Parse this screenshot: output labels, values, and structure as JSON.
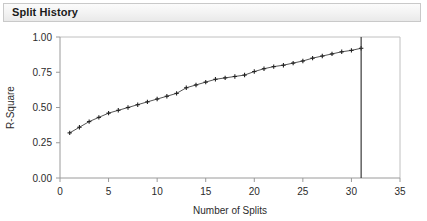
{
  "panel": {
    "title": "Split History"
  },
  "chart_data": {
    "type": "line",
    "title": "Split History",
    "xlabel": "Number of Splits",
    "ylabel": "R-Square",
    "xlim": [
      0,
      35
    ],
    "ylim": [
      0.0,
      1.0
    ],
    "xticks": [
      0,
      5,
      10,
      15,
      20,
      25,
      30,
      35
    ],
    "xticklabels": [
      "0",
      "5",
      "10",
      "15",
      "20",
      "25",
      "30",
      "35"
    ],
    "yticks": [
      0.0,
      0.25,
      0.5,
      0.75,
      1.0
    ],
    "yticklabels": [
      "0.00",
      "0.25",
      "0.50",
      "0.75",
      "1.00"
    ],
    "grid": false,
    "legend": null,
    "marker": "cross",
    "line_color": "#555555",
    "marker_color": "#222222",
    "x": [
      1,
      2,
      3,
      4,
      5,
      6,
      7,
      8,
      9,
      10,
      11,
      12,
      13,
      14,
      15,
      16,
      17,
      18,
      19,
      20,
      21,
      22,
      23,
      24,
      25,
      26,
      27,
      28,
      29,
      30,
      31
    ],
    "values": [
      0.32,
      0.36,
      0.4,
      0.43,
      0.46,
      0.48,
      0.5,
      0.52,
      0.54,
      0.56,
      0.58,
      0.6,
      0.64,
      0.66,
      0.68,
      0.7,
      0.71,
      0.72,
      0.73,
      0.755,
      0.775,
      0.79,
      0.8,
      0.815,
      0.83,
      0.85,
      0.865,
      0.88,
      0.895,
      0.905,
      0.92
    ],
    "reference_line": {
      "orientation": "vertical",
      "x": 31,
      "color": "#3a3a3a"
    }
  }
}
